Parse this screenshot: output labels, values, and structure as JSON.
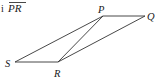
{
  "header": {
    "prefix_fragment": "i",
    "segment_label": "PR",
    "overline": true
  },
  "diagram": {
    "stroke_color": "#333333",
    "vertices": [
      {
        "name": "P",
        "x": 103,
        "y": 16
      },
      {
        "name": "Q",
        "x": 145,
        "y": 16
      },
      {
        "name": "R",
        "x": 58,
        "y": 62
      },
      {
        "name": "S",
        "x": 15,
        "y": 62
      }
    ],
    "segments": [
      [
        "S",
        "P"
      ],
      [
        "P",
        "Q"
      ],
      [
        "Q",
        "R"
      ],
      [
        "R",
        "S"
      ],
      [
        "P",
        "R"
      ]
    ],
    "labels": {
      "P": "P",
      "Q": "Q",
      "R": "R",
      "S": "S"
    }
  }
}
